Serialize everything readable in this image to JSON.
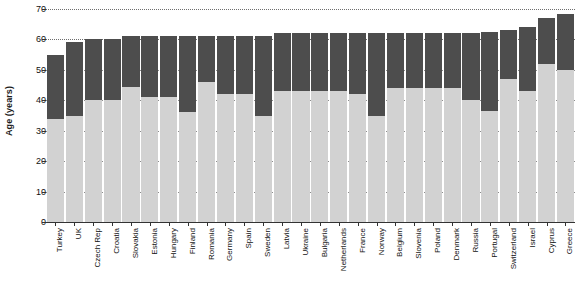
{
  "chart_data": {
    "type": "bar",
    "subtype": "stacked",
    "title": "",
    "xlabel": "",
    "ylabel": "Age (years)",
    "ylim": [
      0,
      70
    ],
    "yticks": [
      0,
      10,
      20,
      30,
      40,
      50,
      60,
      70
    ],
    "grid": true,
    "legend": "none",
    "categories": [
      "Turkey",
      "UK",
      "Czech Rep",
      "Croatia",
      "Slovakia",
      "Estonia",
      "Hungary",
      "Finland",
      "Romania",
      "Germany",
      "Spain",
      "Sweden",
      "Latvia",
      "Ukraine",
      "Bulgaria",
      "Netherlands",
      "France",
      "Norway",
      "Belgium",
      "Slovenia",
      "Poland",
      "Denmark",
      "Russia",
      "Portugal",
      "Switzerland",
      "Israel",
      "Cyprus",
      "Greece"
    ],
    "series": [
      {
        "name": "lower-segment",
        "color": "#d2d2d2",
        "values": [
          34,
          35,
          40,
          40,
          44.5,
          41,
          41,
          36,
          46,
          42,
          42,
          35,
          43,
          43,
          43,
          43,
          42,
          35,
          44,
          44,
          44,
          44,
          40,
          36.5,
          47,
          43,
          52,
          50
        ]
      },
      {
        "name": "upper-segment",
        "color": "#4d4d4d",
        "values": [
          21,
          24,
          20,
          20,
          16.5,
          20,
          20,
          25,
          15,
          19,
          19,
          26,
          19,
          19,
          19,
          19,
          20,
          27,
          18,
          18,
          18,
          18,
          22,
          26,
          16,
          21,
          15,
          18.5
        ]
      }
    ],
    "totals": [
      55,
      59,
      60,
      60,
      61,
      61,
      61,
      61,
      61,
      61,
      61,
      61,
      62,
      62,
      62,
      62,
      62,
      62,
      62,
      62,
      62,
      62,
      62,
      62.5,
      63,
      64,
      67,
      68.5
    ]
  }
}
